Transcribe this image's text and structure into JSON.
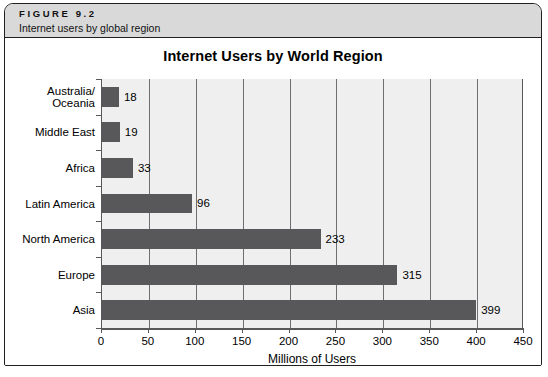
{
  "figure": {
    "number": "FIGURE 9.2",
    "caption": "Internet users by global region"
  },
  "chart_data": {
    "type": "bar",
    "orientation": "horizontal",
    "title": "Internet Users by World Region",
    "xlabel": "Millions of Users",
    "ylabel": "",
    "categories": [
      "Australia/\nOceania",
      "Middle East",
      "Africa",
      "Latin America",
      "North America",
      "Europe",
      "Asia"
    ],
    "values": [
      18,
      19,
      33,
      96,
      233,
      315,
      399
    ],
    "data_labels": [
      "18",
      "19",
      "33",
      "96",
      "233",
      "315",
      "399"
    ],
    "xlim": [
      0,
      450
    ],
    "xticks": [
      0,
      50,
      100,
      150,
      200,
      250,
      300,
      350,
      400,
      450
    ],
    "xtick_labels": [
      "0",
      "50",
      "100",
      "150",
      "200",
      "250",
      "300",
      "350",
      "400",
      "450"
    ],
    "grid": "vertical",
    "legend": "none",
    "bar_color": "#58585A",
    "plot_background": "#EFEFEF",
    "gridline_color": "#6E6E70",
    "axis_color": "#58585A"
  },
  "colors": {
    "header_band": "#D9D9D9",
    "frame_border": "#231F20",
    "page_background": "#FFFFFF"
  },
  "source_note": ""
}
